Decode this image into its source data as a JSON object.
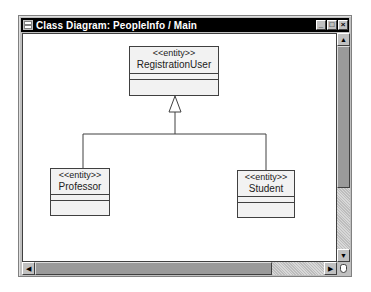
{
  "window": {
    "title": "Class Diagram: PeopleInfo / Main",
    "buttons": {
      "minimize": "_",
      "maximize": "□",
      "close": "×"
    }
  },
  "diagram": {
    "classes": [
      {
        "id": "registration-user",
        "stereotype": "<<entity>>",
        "name": "RegistrationUser"
      },
      {
        "id": "professor",
        "stereotype": "<<entity>>",
        "name": "Professor"
      },
      {
        "id": "student",
        "stereotype": "<<entity>>",
        "name": "Student"
      }
    ],
    "relationships": [
      {
        "type": "generalization",
        "from": "Professor",
        "to": "RegistrationUser"
      },
      {
        "type": "generalization",
        "from": "Student",
        "to": "RegistrationUser"
      }
    ]
  },
  "scrollbars": {
    "vertical": {
      "up_arrow": "▲",
      "down_arrow": "▼"
    },
    "horizontal": {
      "left_arrow": "◀",
      "right_arrow": "▶"
    }
  }
}
